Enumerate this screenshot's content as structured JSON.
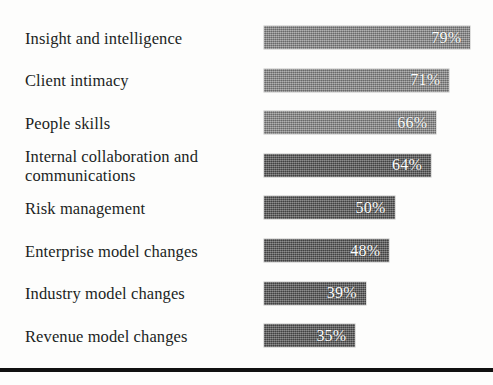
{
  "chart_data": {
    "type": "bar",
    "orientation": "horizontal",
    "title": "",
    "subtitle": "",
    "xlabel": "",
    "ylabel": "",
    "grid": false,
    "legend": null,
    "value_suffix": "%",
    "xlim": [
      0,
      100
    ],
    "categories": [
      "Insight and intelligence",
      "Client intimacy",
      "People skills",
      "Internal collaboration and\ncommunications",
      "Risk management",
      "Enterprise model changes",
      "Industry model changes",
      "Revenue model changes"
    ],
    "values": [
      79,
      71,
      66,
      64,
      50,
      48,
      39,
      35
    ],
    "data_labels": [
      "79%",
      "71%",
      "66%",
      "64%",
      "50%",
      "48%",
      "39%",
      "35%"
    ],
    "series": [
      {
        "name": "Share of respondents",
        "values": [
          79,
          71,
          66,
          64,
          50,
          48,
          39,
          35
        ]
      }
    ],
    "bar_shades": [
      "light",
      "light",
      "light",
      "dark",
      "dark",
      "dark",
      "dark",
      "dark"
    ]
  },
  "colors": {
    "background": "#fdfdfc",
    "bar_light": "#8b8b8b",
    "bar_dark": "#565656",
    "label_text": "#211f1e",
    "value_text": "#ffffff",
    "rule": "#111111"
  }
}
